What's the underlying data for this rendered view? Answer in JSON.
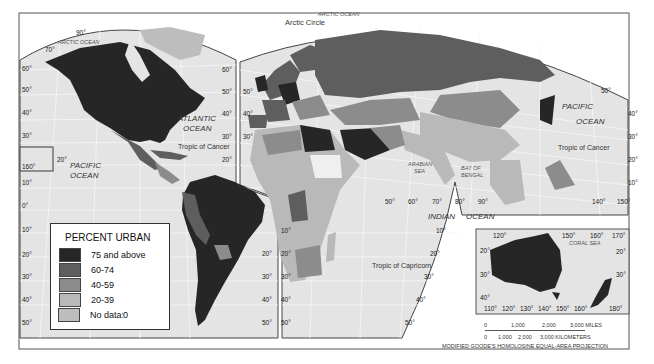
{
  "map": {
    "title": "Percent Urban",
    "projection_note": "MODIFIED GOODE'S HOMOLOSINE EQUAL-AREA PROJECTION",
    "legend": {
      "title": "PERCENT URBAN",
      "items": [
        {
          "label": "75 and above",
          "color": "#262626"
        },
        {
          "label": "60-74",
          "color": "#5e5e5e"
        },
        {
          "label": "40-59",
          "color": "#8c8c8c"
        },
        {
          "label": "20-39",
          "color": "#b9b9b9"
        },
        {
          "label": "Below 20",
          "color": "#efefef"
        }
      ],
      "nodata": {
        "label": "No data",
        "color": "#bdbdbd"
      }
    },
    "labels": {
      "arctic_ocean_w": "ARCTIC OCEAN",
      "arctic_ocean_e": "ARCTIC OCEAN",
      "arctic_circle": "Arctic Circle",
      "atlantic_1": "ATLANTIC",
      "atlantic_2": "OCEAN",
      "pacific_w_1": "PACIFIC",
      "pacific_w_2": "OCEAN",
      "pacific_e_1": "PACIFIC",
      "pacific_e_2": "OCEAN",
      "tropic_cancer_w": "Tropic of Cancer",
      "tropic_cancer_e": "Tropic of Cancer",
      "tropic_capricorn": "Tropic of Capricorn",
      "indian": "INDIAN",
      "ocean_indian": "OCEAN",
      "arabian_1": "ARABIAN",
      "arabian_2": "SEA",
      "bengal_1": "BAY OF",
      "bengal_2": "BENGAL",
      "coral_sea": "CORAL  SEA"
    },
    "scale": {
      "miles": [
        "0",
        "1,000",
        "2,000",
        "3,000 MILES"
      ],
      "km": [
        "0",
        "1,000",
        "2,000",
        "3,000 KILOMETERS"
      ]
    },
    "degrees": {
      "na_top": "90°",
      "na_70": "70°",
      "w60": "60°",
      "w50": "50°",
      "w40": "40°",
      "w30": "30°",
      "w20": "20°",
      "w10": "10°",
      "w0": "0°",
      "w10s": "10°",
      "w20s": "20°",
      "w30s": "30°",
      "w40s": "40°",
      "w50s": "50°",
      "hawaii": "160°",
      "pac20": "20°",
      "na_r60": "60°",
      "na_r50": "50°",
      "na_r40": "40°",
      "na_r30": "30°",
      "na_r20": "20°",
      "eu_50": "50°",
      "eu_40": "40°",
      "eu_30": "30°",
      "eu_lat60": "60°",
      "sa_r20": "20°",
      "sa_r30": "30°",
      "sa_r40": "40°",
      "sa_r50": "50°",
      "sa_10n": "10°",
      "sa_0": "0°",
      "af_10": "10°",
      "af_20": "20°",
      "af_30": "30°",
      "af_40": "40°",
      "af_50": "50°",
      "in_50": "50°",
      "in_60": "60°",
      "in_70": "70°",
      "in_80": "80°",
      "in_90": "90°",
      "in_r10": "10°",
      "in_r20": "20°",
      "in_r30": "30°",
      "in_r40": "40°",
      "in_r50": "50°",
      "pe_50": "50°",
      "pe_40": "40°",
      "pe_30": "30°",
      "pe_20": "20°",
      "pe_10": "10°",
      "pe_140": "140°",
      "pe_150": "150°",
      "au_120": "120°",
      "au_150": "150°",
      "au_160": "160°",
      "au_170": "170°",
      "au_l20": "20°",
      "au_l30": "30°",
      "au_l40": "40°",
      "au_r20": "20°",
      "au_r30": "30°",
      "au_b110": "110°",
      "au_b120": "120°",
      "au_b130": "130°",
      "au_b140": "140°",
      "au_b150": "150°",
      "au_b160": "160°",
      "au_b180": "180°"
    }
  }
}
